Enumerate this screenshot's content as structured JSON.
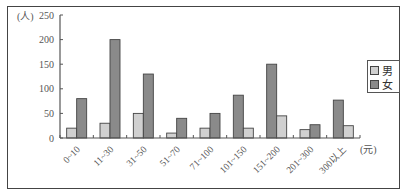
{
  "chart_data": {
    "type": "bar",
    "title": "",
    "xlabel": "(元)",
    "ylabel": "(人)",
    "ylim": [
      0,
      250
    ],
    "yticks": [
      0,
      50,
      100,
      150,
      200,
      250
    ],
    "grid": false,
    "legend_position": "right",
    "categories": [
      "0~10",
      "11~30",
      "31~50",
      "51~70",
      "71~100",
      "101~150",
      "151~200",
      "201~300",
      "300以上"
    ],
    "series": [
      {
        "name": "男",
        "color": "#d0d0d0",
        "values": [
          20,
          30,
          50,
          10,
          20,
          20,
          45,
          17,
          25
        ]
      },
      {
        "name": "女",
        "color": "#8a8a8a",
        "values": [
          80,
          200,
          130,
          40,
          50,
          87,
          150,
          27,
          77
        ]
      }
    ],
    "bar_order": [
      [
        "男",
        "女"
      ],
      [
        "男",
        "女"
      ],
      [
        "男",
        "女"
      ],
      [
        "男",
        "女"
      ],
      [
        "男",
        "女"
      ],
      [
        "女",
        "男"
      ],
      [
        "女",
        "男"
      ],
      [
        "男",
        "女"
      ],
      [
        "女",
        "男"
      ]
    ]
  },
  "axis": {
    "y_unit": "(人)",
    "x_unit": "(元)"
  },
  "legend": {
    "items": [
      {
        "label": "男"
      },
      {
        "label": "女"
      }
    ]
  }
}
